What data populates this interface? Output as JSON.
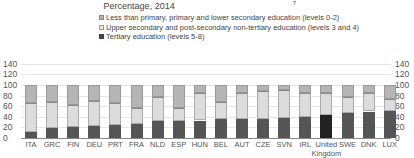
{
  "chart_data": {
    "type": "bar",
    "stacked": true,
    "title": "Percentage, 2014",
    "title_superscript": "7",
    "xlabel": "",
    "ylabel": "",
    "ylim": [
      0,
      140
    ],
    "y_ticks": [
      "0",
      "20",
      "40",
      "60",
      "80",
      "100",
      "120",
      "140"
    ],
    "grid": true,
    "legend_position": "top-center",
    "categories": [
      "ITA",
      "GRC",
      "FIN",
      "DEU",
      "PRT",
      "FRA",
      "NLD",
      "ESP",
      "HUN",
      "BEL",
      "AUT",
      "CZE",
      "SVN",
      "IRL",
      "United Kingdom",
      "SWE",
      "DNK",
      "LUX"
    ],
    "series": [
      {
        "name": "Tertiary education (levels 5-8)",
        "color": "#555555",
        "values": [
          12,
          19,
          20,
          23,
          25,
          27,
          32,
          32,
          33,
          35,
          35,
          36,
          38,
          40,
          43,
          48,
          50,
          51
        ]
      },
      {
        "name": "Upper secondary and post-secondary non-tertiary education (levels 3 and 4)",
        "color": "#dcdcdc",
        "values": [
          54,
          49,
          42,
          46,
          41,
          30,
          45,
          24,
          52,
          32,
          50,
          53,
          53,
          45,
          42,
          29,
          35,
          23
        ]
      },
      {
        "name": "Less than primary, primary and lower secondary education (levels 0-2)",
        "color": "#b5b5b5",
        "values": [
          34,
          32,
          38,
          31,
          34,
          43,
          23,
          44,
          15,
          33,
          15,
          11,
          9,
          15,
          15,
          23,
          15,
          26
        ]
      }
    ],
    "highlight": {
      "category": "United Kingdom",
      "tertiary_color": "#222222"
    }
  },
  "legend": [
    {
      "label": "Less than primary, primary and lower secondary education (levels 0-2)",
      "swatch": "#b5b5b5"
    },
    {
      "label": "Upper secondary and post-secondary non-tertiary education (levels 3 and 4)",
      "swatch": "#dcdcdc"
    },
    {
      "label": "Tertiary education (levels 5-8)",
      "swatch": "#555555"
    }
  ],
  "x_labels": [
    "ITA",
    "GRC",
    "FIN",
    "DEU",
    "PRT",
    "FRA",
    "NLD",
    "ESP",
    "HUN",
    "BEL",
    "AUT",
    "CZE",
    "SVN",
    "IRL",
    "United\nKingdom",
    "SWE",
    "DNK",
    "LUX"
  ]
}
